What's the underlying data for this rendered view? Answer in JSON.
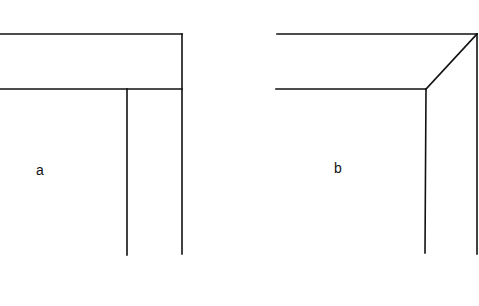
{
  "figure": {
    "panels": [
      {
        "label": "a",
        "description": "Butt joint corner: horizontal board overlapping vertical board",
        "label_pos": [
          40,
          175
        ],
        "lines": [
          [
            0,
            34,
            182,
            34
          ],
          [
            0,
            89,
            182,
            89
          ],
          [
            182,
            34,
            182,
            254
          ],
          [
            127,
            89,
            127,
            255
          ]
        ]
      },
      {
        "label": "b",
        "description": "Mitred corner: boards meeting at a 45-degree diagonal",
        "label_pos": [
          334,
          173
        ],
        "lines": [
          [
            277,
            34,
            477,
            34
          ],
          [
            276,
            89,
            426,
            89
          ],
          [
            426,
            89,
            477,
            34
          ],
          [
            426,
            89,
            424,
            253
          ],
          [
            477,
            34,
            477,
            254
          ]
        ]
      }
    ]
  }
}
